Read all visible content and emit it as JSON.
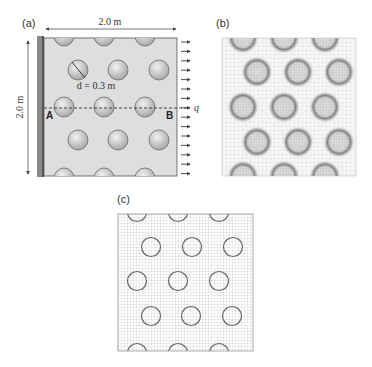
{
  "panels": {
    "a": {
      "label": "(a)",
      "width_dim": "2.0 m",
      "height_dim": "2.0 m",
      "diameter_label": "d = 0.3 m",
      "point_left": "A",
      "point_right": "B",
      "load_label": "q",
      "arrow_count": 15,
      "colors": {
        "plate": "#dcdcdc",
        "wall": "#7a7a7a",
        "inclusion": "#c8c8c8",
        "edge": "#555555"
      }
    },
    "b": {
      "label": "(b)",
      "description": "unstructured finite element mesh refined around inclusions"
    },
    "c": {
      "label": "(c)",
      "description": "regular structured grid with circular inclusion boundaries"
    }
  }
}
